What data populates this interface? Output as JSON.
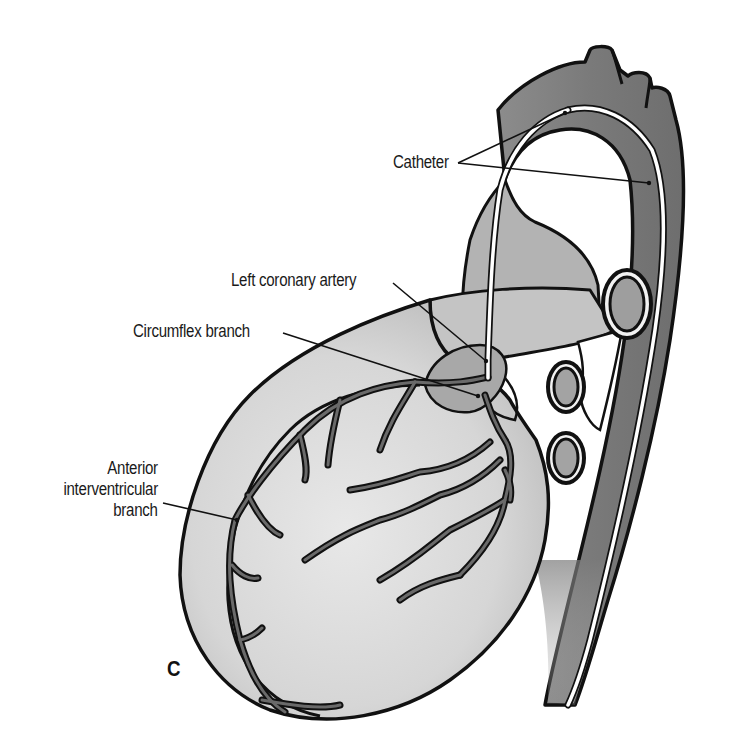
{
  "figure": {
    "panel_letter": "C",
    "labels": {
      "catheter": "Catheter",
      "left_coronary_artery": "Left coronary artery",
      "circumflex_branch": "Circumflex branch",
      "anterior_interventricular_line1": "Anterior",
      "anterior_interventricular_line2": "interventricular",
      "anterior_interventricular_line3": "branch"
    },
    "colors": {
      "background": "#ffffff",
      "outline": "#111111",
      "aorta_fill": "#7d7d7d",
      "heart_fill": "#d9d9d9",
      "heart_inner_fill": "#e6e6e6",
      "vessel_fill": "#6a6a6a",
      "catheter": "#ffffff",
      "shadow": "#8a8a8a"
    }
  }
}
